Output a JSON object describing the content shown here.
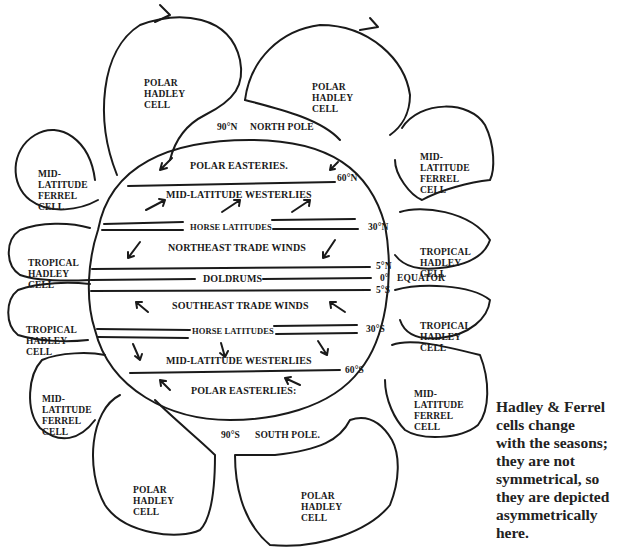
{
  "diagram": {
    "cells": [
      {
        "id": "nw-polar",
        "lines": [
          "POLAR",
          "HADLEY",
          "CELL"
        ]
      },
      {
        "id": "ne-polar",
        "lines": [
          "POLAR",
          "HADLEY",
          "CELL"
        ]
      },
      {
        "id": "w-north-ferrel",
        "lines": [
          "MID-",
          "LATITUDE",
          "FERREL",
          "CELL"
        ]
      },
      {
        "id": "e-north-ferrel",
        "lines": [
          "MID-",
          "LATITUDE",
          "FERREL",
          "CELL"
        ]
      },
      {
        "id": "w-north-tropical",
        "lines": [
          "TROPICAL",
          "HADLEY",
          "CELL"
        ]
      },
      {
        "id": "e-north-tropical",
        "lines": [
          "TROPICAL",
          "HADLEY",
          "CELL"
        ]
      },
      {
        "id": "w-south-tropical",
        "lines": [
          "TROPICAL",
          "HADLEY",
          "CELL"
        ]
      },
      {
        "id": "e-south-tropical",
        "lines": [
          "TROPICAL",
          "HADLEY",
          "CELL"
        ]
      },
      {
        "id": "w-south-ferrel",
        "lines": [
          "MID-",
          "LATITUDE",
          "FERREL",
          "CELL"
        ]
      },
      {
        "id": "e-south-ferrel",
        "lines": [
          "MID-",
          "LATITUDE",
          "FERREL",
          "CELL"
        ]
      },
      {
        "id": "sw-polar",
        "lines": [
          "POLAR",
          "HADLEY",
          "CELL"
        ]
      },
      {
        "id": "se-polar",
        "lines": [
          "POLAR",
          "HADLEY",
          "CELL"
        ]
      }
    ],
    "wind_belts": [
      "POLAR EASTERIES.",
      "MID-LATITUDE WESTERLIES",
      "HORSE LATITUDES",
      "NORTHEAST TRADE WINDS",
      "DOLDRUMS",
      "SOUTHEAST TRADE WINDS",
      "HORSE LATITUDES",
      "MID-LATITUDE WESTERLIES",
      "POLAR EASTERLIES:"
    ],
    "latitudes": {
      "north_pole_deg": "90°N",
      "north_pole_name": "NORTH POLE",
      "n60": "60°N",
      "n30": "30°N",
      "n5": "5°N",
      "equator_deg": "0°",
      "equator_name": "EQUATOR",
      "s5": "5°S",
      "s30": "30°S",
      "s60": "60°S",
      "south_pole_deg": "90°S",
      "south_pole_name": "SOUTH POLE."
    },
    "note_lines": [
      "Hadley & Ferrel",
      "cells change",
      "with the seasons;",
      "they are not",
      "symmetrical, so",
      "they are depicted",
      "asymmetrically",
      "here."
    ]
  },
  "colors": {
    "ink": "#1a1a1a",
    "background": "#ffffff"
  }
}
